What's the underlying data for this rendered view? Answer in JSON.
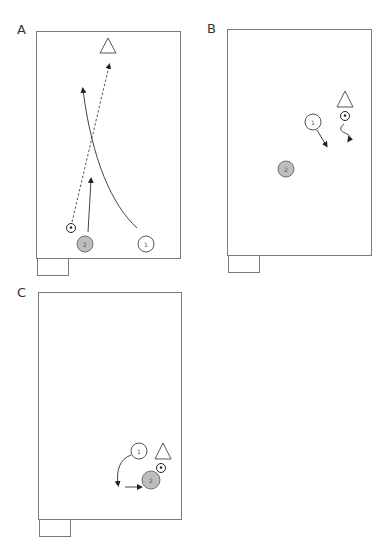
{
  "diagram": {
    "type": "soccer-drill-sequence",
    "panels": [
      {
        "id": "A",
        "label": "A",
        "players": [
          {
            "number": "1",
            "team": "white"
          },
          {
            "number": "2",
            "team": "grey"
          }
        ],
        "items": [
          "cone",
          "ball"
        ],
        "movements": [
          {
            "type": "pass",
            "style": "dashed",
            "from": "ball",
            "to": "cone-area"
          },
          {
            "type": "run",
            "style": "curved-solid",
            "from": "player-1",
            "to": "upfield"
          },
          {
            "type": "run",
            "style": "solid",
            "from": "player-2",
            "to": "upfield"
          }
        ]
      },
      {
        "id": "B",
        "label": "B",
        "players": [
          {
            "number": "1",
            "team": "white"
          },
          {
            "number": "2",
            "team": "grey"
          }
        ],
        "items": [
          "cone",
          "ball"
        ],
        "movements": [
          {
            "type": "dribble",
            "style": "wavy",
            "from": "ball",
            "to": "down"
          },
          {
            "type": "run",
            "style": "solid",
            "from": "player-1",
            "to": "down-right"
          }
        ]
      },
      {
        "id": "C",
        "label": "C",
        "players": [
          {
            "number": "1",
            "team": "white"
          },
          {
            "number": "2",
            "team": "grey"
          }
        ],
        "items": [
          "cone",
          "ball"
        ],
        "movements": [
          {
            "type": "run",
            "style": "curved-solid",
            "from": "player-1",
            "to": "down"
          },
          {
            "type": "run",
            "style": "solid",
            "from": "curve-end",
            "to": "player-2"
          }
        ]
      }
    ]
  },
  "colors": {
    "frame": "#7a7a7a",
    "grey_player": "#bdbdbd",
    "line": "#444444"
  }
}
